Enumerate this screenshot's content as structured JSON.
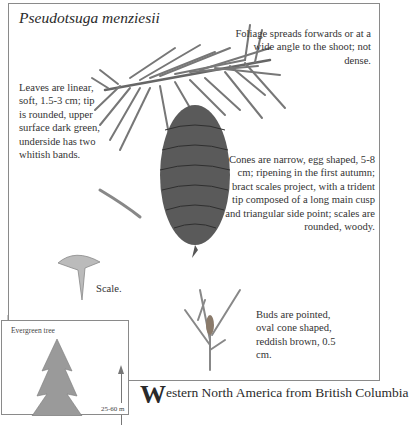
{
  "title": "Pseudotsuga menziesii",
  "descriptions": {
    "foliage": "Foliage spreads forwards or at a wide angle to the shoot; not dense.",
    "leaves": "Leaves are linear, soft, 1.5-3 cm; tip is rounded, upper surface dark green, underside has two whitish bands.",
    "cones": "Cones are narrow, egg shaped, 5-8 cm; ripening in the first autumn; bract scales project, with a trident tip composed of a long main cusp and triangular side point; scales are rounded, woody.",
    "scale": "Scale.",
    "buds": "Buds are pointed, oval cone shaped, reddish brown, 0.5 cm."
  },
  "inset": {
    "label": "Evergreen tree",
    "height": "25-60 m"
  },
  "body_text": {
    "dropcap": "W",
    "rest": "estern North America from British Columbia"
  }
}
